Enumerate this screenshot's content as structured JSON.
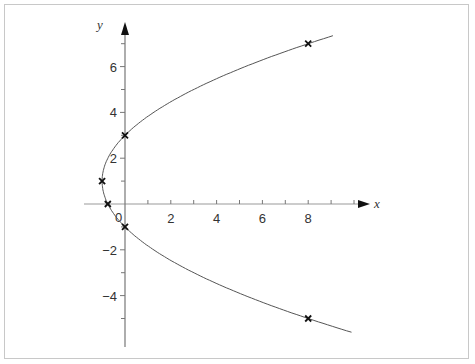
{
  "chart_data": {
    "type": "line",
    "title": "",
    "xlabel": "x",
    "ylabel": "y",
    "xlim": [
      -1.8,
      10.7
    ],
    "ylim": [
      -6.2,
      7.9
    ],
    "grid": false,
    "x_ticks": [
      {
        "value": 0,
        "label": "0"
      },
      {
        "value": 2,
        "label": "2"
      },
      {
        "value": 4,
        "label": "4"
      },
      {
        "value": 6,
        "label": "6"
      },
      {
        "value": 8,
        "label": "8"
      }
    ],
    "x_minor_ticks": [
      1,
      3,
      5,
      7,
      9,
      10
    ],
    "y_ticks": [
      {
        "value": 6,
        "label": "6"
      },
      {
        "value": 4,
        "label": "4"
      },
      {
        "value": 2,
        "label": "2"
      },
      {
        "value": -2,
        "label": "-2"
      },
      {
        "value": -4,
        "label": "-4"
      }
    ],
    "y_minor_ticks": [
      7,
      5,
      3,
      1,
      -1,
      -3,
      -5
    ],
    "series": [
      {
        "name": "parabola x = (y-1)^2/4 - 1",
        "equation": "x = (y - 1)^2 / 4 - 1",
        "style": "curve",
        "y_range": [
          -5.6,
          7.35
        ]
      }
    ],
    "marked_points": [
      {
        "x": 8,
        "y": 7,
        "marker": "x"
      },
      {
        "x": 0,
        "y": 3,
        "marker": "x"
      },
      {
        "x": -1,
        "y": 1,
        "marker": "x"
      },
      {
        "x": -0.75,
        "y": 0,
        "marker": "x"
      },
      {
        "x": 0,
        "y": -1,
        "marker": "x"
      },
      {
        "x": 8,
        "y": -5,
        "marker": "x"
      }
    ]
  },
  "labels": {
    "x_axis": "x",
    "y_axis": "y",
    "origin": "0",
    "x_ticks": [
      "2",
      "4",
      "6",
      "8"
    ],
    "y_ticks": [
      "6",
      "4",
      "2",
      "−2",
      "−4"
    ]
  }
}
